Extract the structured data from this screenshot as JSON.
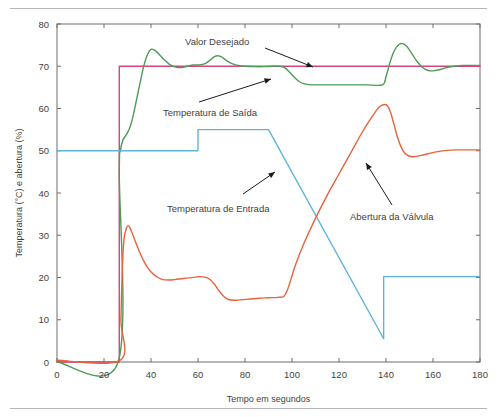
{
  "figure": {
    "background_color": "#ffffff",
    "frame_color": "#6e6e6e",
    "top_rule": "horizontal-rule",
    "bottom_rule": "horizontal-rule"
  },
  "chart_data": {
    "type": "line",
    "title": "",
    "xlabel": "Tempo em segundos",
    "ylabel": "Temperatura (°C) e abertura (%)",
    "xlim": [
      0,
      180
    ],
    "ylim": [
      0,
      80
    ],
    "xticks": [
      0,
      20,
      40,
      60,
      80,
      100,
      120,
      140,
      160,
      180
    ],
    "yticks": [
      0,
      10,
      20,
      30,
      40,
      50,
      60,
      70,
      80
    ],
    "xtick_labels": [
      "0",
      "20",
      "40",
      "60",
      "80",
      "100",
      "120",
      "140",
      "160",
      "180"
    ],
    "ytick_labels": [
      "0",
      "10",
      "20",
      "30",
      "40",
      "50",
      "60",
      "70",
      "80"
    ],
    "grid": false,
    "legend_position": "inline-annotations",
    "series": [
      {
        "name": "Valor Desejado",
        "color": "#d6437e",
        "points": [
          [
            0,
            0
          ],
          [
            26.5,
            0
          ],
          [
            26.5,
            70
          ],
          [
            180,
            70
          ]
        ]
      },
      {
        "name": "Temperatura de Saída",
        "color": "#4e9a56",
        "points": [
          [
            0,
            0
          ],
          [
            26.0,
            0
          ],
          [
            26.5,
            45
          ],
          [
            27.0,
            50
          ],
          [
            28.0,
            52.5
          ],
          [
            29.5,
            53.8
          ],
          [
            31.0,
            55.5
          ],
          [
            32.5,
            58.5
          ],
          [
            34.0,
            62.5
          ],
          [
            35.5,
            66.5
          ],
          [
            37.0,
            70.2
          ],
          [
            38.5,
            72.8
          ],
          [
            40.0,
            74.0
          ],
          [
            41.5,
            73.8
          ],
          [
            43.5,
            72.8
          ],
          [
            45.5,
            71.6
          ],
          [
            48.0,
            70.4
          ],
          [
            50.5,
            69.8
          ],
          [
            53.0,
            69.7
          ],
          [
            55.5,
            70.0
          ],
          [
            58.0,
            70.3
          ],
          [
            60.5,
            70.3
          ],
          [
            63.0,
            70.6
          ],
          [
            65.0,
            71.4
          ],
          [
            67.0,
            72.3
          ],
          [
            68.5,
            72.5
          ],
          [
            70.0,
            72.2
          ],
          [
            72.0,
            71.4
          ],
          [
            74.5,
            70.6
          ],
          [
            77.0,
            70.2
          ],
          [
            80.0,
            70.0
          ],
          [
            84.0,
            69.9
          ],
          [
            88.0,
            69.9
          ],
          [
            92.0,
            70.0
          ],
          [
            95.0,
            70.0
          ],
          [
            97.0,
            69.6
          ],
          [
            99.0,
            68.6
          ],
          [
            101.0,
            67.4
          ],
          [
            103.0,
            66.4
          ],
          [
            105.0,
            65.9
          ],
          [
            108.0,
            65.6
          ],
          [
            112.0,
            65.6
          ],
          [
            118.0,
            65.6
          ],
          [
            125.0,
            65.6
          ],
          [
            132.0,
            65.6
          ],
          [
            138.5,
            65.6
          ],
          [
            140.0,
            67.5
          ],
          [
            141.5,
            70.5
          ],
          [
            143.0,
            73.0
          ],
          [
            144.5,
            74.6
          ],
          [
            146.0,
            75.3
          ],
          [
            147.5,
            75.3
          ],
          [
            149.0,
            74.6
          ],
          [
            151.0,
            73.0
          ],
          [
            153.0,
            71.3
          ],
          [
            155.0,
            70.0
          ],
          [
            157.0,
            69.2
          ],
          [
            159.0,
            68.9
          ],
          [
            161.0,
            69.0
          ],
          [
            163.5,
            69.3
          ],
          [
            166.0,
            69.7
          ],
          [
            169.0,
            70.0
          ],
          [
            173.0,
            70.2
          ],
          [
            177.0,
            70.2
          ],
          [
            180,
            70.2
          ]
        ]
      },
      {
        "name": "Temperatura de Entrada",
        "color": "#5fb4dd",
        "points": [
          [
            0,
            50
          ],
          [
            60,
            50
          ],
          [
            60,
            55
          ],
          [
            90,
            55
          ],
          [
            139,
            5.5
          ],
          [
            139,
            20.2
          ],
          [
            180,
            20.2
          ]
        ]
      },
      {
        "name": "Abertura da Válvula",
        "color": "#e8633c",
        "points": [
          [
            0,
            0.4
          ],
          [
            26.8,
            0.4
          ],
          [
            27.2,
            10
          ],
          [
            27.8,
            22
          ],
          [
            28.5,
            29
          ],
          [
            29.5,
            31.6
          ],
          [
            30.5,
            32.2
          ],
          [
            31.5,
            31.2
          ],
          [
            33.0,
            29.0
          ],
          [
            35.0,
            26.2
          ],
          [
            37.0,
            23.8
          ],
          [
            39.0,
            22.0
          ],
          [
            41.0,
            20.8
          ],
          [
            43.0,
            20.0
          ],
          [
            45.0,
            19.5
          ],
          [
            47.5,
            19.4
          ],
          [
            50.0,
            19.5
          ],
          [
            53.0,
            19.7
          ],
          [
            56.0,
            19.9
          ],
          [
            59.0,
            20.1
          ],
          [
            61.0,
            20.2
          ],
          [
            63.0,
            20.1
          ],
          [
            65.0,
            19.6
          ],
          [
            67.0,
            18.4
          ],
          [
            69.0,
            16.8
          ],
          [
            71.0,
            15.5
          ],
          [
            73.0,
            14.8
          ],
          [
            75.5,
            14.6
          ],
          [
            78.0,
            14.7
          ],
          [
            82.0,
            14.9
          ],
          [
            86.0,
            15.1
          ],
          [
            90.0,
            15.2
          ],
          [
            94.0,
            15.3
          ],
          [
            96.5,
            15.5
          ],
          [
            98.0,
            17.0
          ],
          [
            99.5,
            19.5
          ],
          [
            101.5,
            23.0
          ],
          [
            105.0,
            28.0
          ],
          [
            110.0,
            34.0
          ],
          [
            115.0,
            39.5
          ],
          [
            120.0,
            44.5
          ],
          [
            125.0,
            49.5
          ],
          [
            130.0,
            54.5
          ],
          [
            134.0,
            58.0
          ],
          [
            137.0,
            60.3
          ],
          [
            139.0,
            60.9
          ],
          [
            140.5,
            60.7
          ],
          [
            142.0,
            59.0
          ],
          [
            143.5,
            56.0
          ],
          [
            145.0,
            53.0
          ],
          [
            146.5,
            50.8
          ],
          [
            148.0,
            49.4
          ],
          [
            150.0,
            48.7
          ],
          [
            152.0,
            48.6
          ],
          [
            155.0,
            48.9
          ],
          [
            158.0,
            49.3
          ],
          [
            162.0,
            49.8
          ],
          [
            166.0,
            50.1
          ],
          [
            170.0,
            50.2
          ],
          [
            175.0,
            50.2
          ],
          [
            180,
            50.2
          ]
        ]
      }
    ],
    "annotations": [
      {
        "label": "Valor Desejado",
        "text_x": 185,
        "text_y": 45,
        "arrow_from": [
          265,
          48
        ],
        "arrow_to": [
          313,
          67
        ]
      },
      {
        "label": "Temperatura de Saída",
        "text_x": 163,
        "text_y": 116,
        "arrow_from": [
          199,
          102
        ],
        "arrow_to": [
          271,
          79
        ]
      },
      {
        "label": "Temperatura de Entrada",
        "text_x": 167,
        "text_y": 212,
        "arrow_from": [
          243,
          194
        ],
        "arrow_to": [
          275,
          172
        ]
      },
      {
        "label": "Abertura da Válvula",
        "text_x": 350,
        "text_y": 220,
        "arrow_from": [
          392,
          205
        ],
        "arrow_to": [
          366,
          163
        ]
      }
    ]
  }
}
